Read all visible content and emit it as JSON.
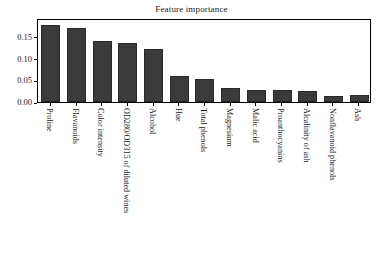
{
  "chart_data": {
    "type": "bar",
    "title": "Feature importance",
    "xlabel": "",
    "ylabel": "",
    "ylim": [
      0.0,
      0.1938
    ],
    "grid": false,
    "legend": null,
    "orientation": "vertical",
    "bar_color": "#3a3a3a",
    "background_color": "#ffffff",
    "frame_color": "#000000",
    "xtick_rotation": 90,
    "yticks": [
      0.0,
      0.05,
      0.1,
      0.15
    ],
    "ytick_labels": [
      "0.00",
      "0.05",
      "0.10",
      "0.15"
    ],
    "categories": [
      "Proline",
      "Flavanoids",
      "Color intensity",
      "OD280/OD315 of diluted wines",
      "Alcohol",
      "Hue",
      "Total phenols",
      "Magnesium",
      "Malic acid",
      "Proanthocyanins",
      "Alcalinity of ash",
      "Nonflavanoid phenols",
      "Ash"
    ],
    "values": [
      0.177,
      0.17,
      0.141,
      0.136,
      0.122,
      0.06,
      0.052,
      0.033,
      0.028,
      0.028,
      0.025,
      0.015,
      0.016
    ]
  }
}
